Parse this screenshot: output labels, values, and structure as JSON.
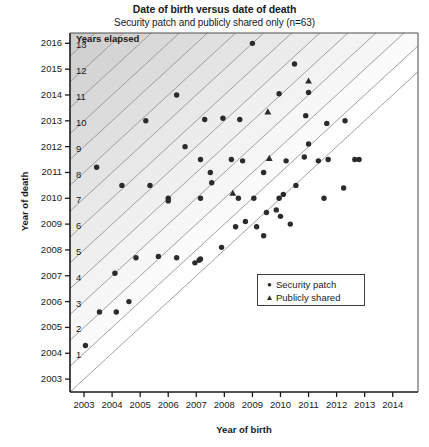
{
  "chart_data": {
    "type": "scatter",
    "title": "Date of birth versus date of death",
    "subtitle": "Security patch and publicly shared only (n=63)",
    "xlabel": "Year of birth",
    "ylabel": "Year of death",
    "xlim": [
      2002.5,
      2014.9
    ],
    "ylim": [
      2002.5,
      2016.4
    ],
    "xticks": [
      "2003",
      "2004",
      "2005",
      "2006",
      "2007",
      "2008",
      "2009",
      "2010",
      "2011",
      "2012",
      "2013",
      "2014"
    ],
    "yticks": [
      "2003",
      "2004",
      "2005",
      "2006",
      "2007",
      "2008",
      "2009",
      "2010",
      "2011",
      "2012",
      "2013",
      "2014",
      "2015",
      "2016"
    ],
    "grid": false,
    "legend_position": "center-right",
    "band_caption": "Years elapsed",
    "band_labels": [
      "1",
      "2",
      "3",
      "4",
      "5",
      "6",
      "7",
      "8",
      "9",
      "10",
      "11",
      "12",
      "13"
    ],
    "series": [
      {
        "name": "Security patch",
        "marker": "circle",
        "color": "#2b2b2b",
        "points": [
          [
            2003.05,
            2004.3
          ],
          [
            2003.55,
            2005.6
          ],
          [
            2004.15,
            2005.6
          ],
          [
            2004.6,
            2006.0
          ],
          [
            2004.1,
            2007.1
          ],
          [
            2004.85,
            2007.7
          ],
          [
            2005.65,
            2007.75
          ],
          [
            2006.3,
            2007.7
          ],
          [
            2006.95,
            2007.5
          ],
          [
            2007.1,
            2007.6
          ],
          [
            2007.15,
            2007.65
          ],
          [
            2007.9,
            2008.1
          ],
          [
            2008.4,
            2008.9
          ],
          [
            2008.75,
            2009.1
          ],
          [
            2009.15,
            2008.9
          ],
          [
            2009.5,
            2009.45
          ],
          [
            2009.85,
            2009.55
          ],
          [
            2010.1,
            2010.15
          ],
          [
            2003.45,
            2011.2
          ],
          [
            2006.0,
            2010.0
          ],
          [
            2005.2,
            2013.0
          ],
          [
            2006.0,
            2009.9
          ],
          [
            2006.6,
            2012.0
          ],
          [
            2007.3,
            2013.05
          ],
          [
            2007.95,
            2013.1
          ],
          [
            2008.55,
            2013.05
          ],
          [
            2009.0,
            2016.0
          ],
          [
            2009.95,
            2014.05
          ],
          [
            2010.5,
            2015.2
          ],
          [
            2011.0,
            2014.1
          ],
          [
            2007.15,
            2011.5
          ],
          [
            2007.5,
            2011.0
          ],
          [
            2007.55,
            2010.6
          ],
          [
            2007.15,
            2010.0
          ],
          [
            2008.25,
            2011.5
          ],
          [
            2008.65,
            2011.45
          ],
          [
            2009.4,
            2011.0
          ],
          [
            2010.2,
            2011.45
          ],
          [
            2010.85,
            2011.6
          ],
          [
            2011.35,
            2011.45
          ],
          [
            2011.7,
            2011.5
          ],
          [
            2011.0,
            2012.1
          ],
          [
            2008.5,
            2010.0
          ],
          [
            2009.05,
            2010.0
          ],
          [
            2009.95,
            2010.0
          ],
          [
            2010.55,
            2010.5
          ],
          [
            2010.0,
            2009.3
          ],
          [
            2010.35,
            2009.0
          ],
          [
            2009.4,
            2008.55
          ],
          [
            2010.9,
            2013.2
          ],
          [
            2011.65,
            2012.9
          ],
          [
            2012.3,
            2013.0
          ],
          [
            2012.65,
            2011.5
          ],
          [
            2012.8,
            2011.5
          ],
          [
            2011.55,
            2010.0
          ],
          [
            2012.25,
            2010.4
          ],
          [
            2006.3,
            2014.0
          ],
          [
            2005.35,
            2010.5
          ],
          [
            2004.35,
            2010.5
          ]
        ]
      },
      {
        "name": "Publicly shared",
        "marker": "triangle",
        "color": "#2b2b2b",
        "points": [
          [
            2009.6,
            2011.55
          ],
          [
            2008.3,
            2010.2
          ],
          [
            2009.55,
            2013.35
          ],
          [
            2011.0,
            2014.55
          ]
        ]
      }
    ]
  },
  "legend": {
    "items": [
      {
        "label": "Security patch",
        "symbol": "●"
      },
      {
        "label": "Publicly shared",
        "symbol": "▲"
      }
    ]
  }
}
